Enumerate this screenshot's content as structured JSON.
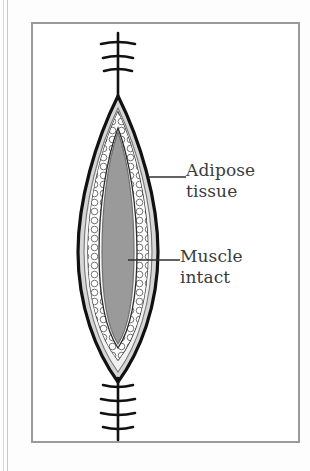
{
  "figure": {
    "type": "medical-illustration",
    "frame": {
      "border_color": "#9a9a9a",
      "background": "#ffffff"
    }
  },
  "labels": [
    {
      "id": "adipose",
      "line1": "Adipose",
      "line2": "tissue",
      "points_to": "adipose-tissue-layer",
      "leader_line": {
        "x1": 148,
        "y1": 177,
        "x2": 186,
        "y2": 177
      }
    },
    {
      "id": "muscle",
      "line1": "Muscle",
      "line2": "intact",
      "points_to": "muscle-core",
      "leader_line": {
        "x1": 128,
        "y1": 260,
        "x2": 180,
        "y2": 260
      }
    }
  ],
  "anatomy": {
    "skin_outline": {
      "name": "skin-outline",
      "color": "#111111"
    },
    "dermis_layer": {
      "name": "dermis-layer",
      "color": "#d6d6d6"
    },
    "adipose_layer": {
      "name": "adipose-tissue-layer",
      "color": "#fafafa",
      "texture": "bubble-cells"
    },
    "muscle_core": {
      "name": "muscle-core",
      "color": "#9a9a9a"
    }
  },
  "sutures": {
    "top": {
      "name": "suture-top",
      "stitch_count": 3
    },
    "bottom": {
      "name": "suture-bottom",
      "stitch_count": 4
    },
    "color": "#111111"
  },
  "colors": {
    "ink": "#111111",
    "text": "#3b3b3b",
    "frame": "#9a9a9a",
    "dermis": "#d6d6d6",
    "muscle": "#9a9a9a",
    "adipose_fill": "#fafafa",
    "page": "#fdfdfd"
  }
}
